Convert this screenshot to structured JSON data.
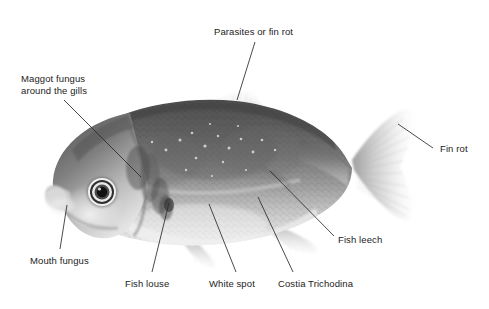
{
  "figure": {
    "kind": "annotated-photograph",
    "background_color": "#ffffff",
    "text_color": "#1c1c1c",
    "leader_line_color": "#2a2a2a"
  },
  "annotations": [
    {
      "id": "parasites-or-fin-rot",
      "text": "Parasites or fin rot",
      "text_x": 214,
      "text_y": 26,
      "align": "left",
      "line": {
        "x1": 255,
        "y1": 42,
        "x2": 237,
        "y2": 100
      }
    },
    {
      "id": "maggot-fungus",
      "text": "Maggot fungus\naround the gills",
      "text_x": 21,
      "text_y": 73,
      "align": "left",
      "line": {
        "x1": 64,
        "y1": 100,
        "x2": 141,
        "y2": 177
      }
    },
    {
      "id": "fin-rot",
      "text": "Fin rot",
      "text_x": 440,
      "text_y": 143,
      "align": "left",
      "line": {
        "x1": 398,
        "y1": 124,
        "x2": 433,
        "y2": 148
      }
    },
    {
      "id": "mouth-fungus",
      "text": "Mouth fungus",
      "text_x": 30,
      "text_y": 255,
      "align": "left",
      "line": {
        "x1": 67,
        "y1": 205,
        "x2": 60,
        "y2": 249
      }
    },
    {
      "id": "fish-leech",
      "text": "Fish leech",
      "text_x": 338,
      "text_y": 234,
      "align": "left",
      "line": {
        "x1": 270,
        "y1": 171,
        "x2": 334,
        "y2": 236
      }
    },
    {
      "id": "fish-louse",
      "text": "Fish louse",
      "text_x": 125,
      "text_y": 278,
      "align": "left",
      "line": {
        "x1": 169,
        "y1": 203,
        "x2": 152,
        "y2": 272
      }
    },
    {
      "id": "white-spot",
      "text": "White spot",
      "text_x": 209,
      "text_y": 278,
      "align": "left",
      "line": {
        "x1": 209,
        "y1": 204,
        "x2": 236,
        "y2": 272
      }
    },
    {
      "id": "costia-trichodina",
      "text": "Costia Trichodina",
      "text_x": 278,
      "text_y": 278,
      "align": "left",
      "line": {
        "x1": 258,
        "y1": 197,
        "x2": 293,
        "y2": 272
      }
    }
  ]
}
